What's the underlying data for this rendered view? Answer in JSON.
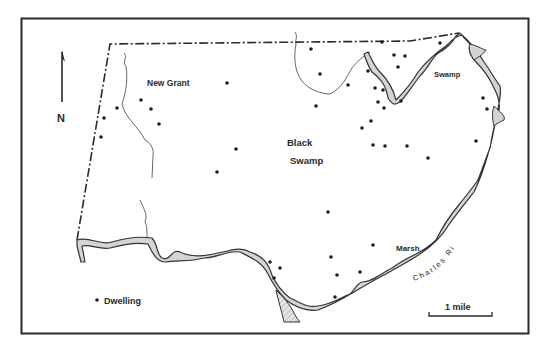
{
  "map": {
    "labels": {
      "new_grant": "New Grant",
      "black": "Black",
      "swamp_center": "Swamp",
      "swamp_ne": "Swamp",
      "marsh": "Marsh",
      "river": "Charles River",
      "north": "N"
    },
    "legend": {
      "dwelling_label": "Dwelling"
    },
    "scale_bar": {
      "label": "1 mile"
    },
    "colors": {
      "frame": "#2a2a2a",
      "river_fill": "#d4d4d4",
      "river_edge": "#333333",
      "boundary": "#2a2a2a",
      "dots": "#1e1e1e"
    },
    "dwellings": [
      [
        311,
        49
      ],
      [
        320,
        74
      ],
      [
        348,
        85
      ],
      [
        382,
        42
      ],
      [
        394,
        55
      ],
      [
        405,
        56
      ],
      [
        398,
        67
      ],
      [
        440,
        43
      ],
      [
        227,
        83
      ],
      [
        141,
        100
      ],
      [
        151,
        109
      ],
      [
        117,
        108
      ],
      [
        159,
        124
      ],
      [
        104,
        118
      ],
      [
        101,
        137
      ],
      [
        368,
        71
      ],
      [
        375,
        88
      ],
      [
        383,
        90
      ],
      [
        378,
        102
      ],
      [
        384,
        108
      ],
      [
        401,
        101
      ],
      [
        316,
        106
      ],
      [
        371,
        121
      ],
      [
        362,
        128
      ],
      [
        373,
        145
      ],
      [
        385,
        146
      ],
      [
        407,
        146
      ],
      [
        428,
        158
      ],
      [
        483,
        98
      ],
      [
        487,
        109
      ],
      [
        476,
        141
      ],
      [
        236,
        149
      ],
      [
        217,
        172
      ],
      [
        328,
        212
      ],
      [
        373,
        245
      ],
      [
        331,
        257
      ],
      [
        337,
        275
      ],
      [
        360,
        272
      ],
      [
        335,
        297
      ],
      [
        270,
        262
      ],
      [
        280,
        268
      ],
      [
        274,
        278
      ]
    ]
  }
}
